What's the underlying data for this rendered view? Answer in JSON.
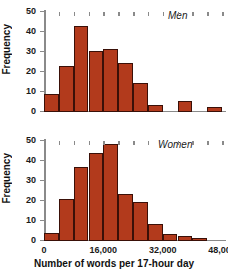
{
  "chart_data": [
    {
      "type": "bar",
      "title": "Men",
      "xlabel": "Number of words per 17-hour day",
      "ylabel": "Frequency",
      "bin_width": 4000,
      "bin_starts": [
        0,
        4000,
        8000,
        12000,
        16000,
        20000,
        24000,
        28000,
        32000,
        36000,
        40000,
        44000
      ],
      "categories": [
        "0-4,000",
        "4,000-8,000",
        "8,000-12,000",
        "12,000-16,000",
        "16,000-20,000",
        "20,000-24,000",
        "24,000-28,000",
        "28,000-32,000",
        "32,000-36,000",
        "36,000-40,000",
        "40,000-44,000",
        "44,000-48,000"
      ],
      "values": [
        9,
        23,
        43,
        30.5,
        31.5,
        24.5,
        14.5,
        3.5,
        0,
        5.5,
        0,
        2.5
      ],
      "xlim": [
        0,
        48000
      ],
      "ylim": [
        0,
        50
      ],
      "ytick_values": [
        0,
        10,
        20,
        30,
        40,
        50
      ],
      "ytick_labels": [
        "0",
        "10",
        "20",
        "30",
        "40",
        "50"
      ],
      "xtick_values": [
        0,
        4000,
        8000,
        12000,
        16000,
        20000,
        24000,
        28000,
        32000,
        36000,
        40000,
        44000,
        48000
      ],
      "xtick_labels": [
        "",
        "",
        "",
        "",
        "",
        "",
        "",
        "",
        "",
        "",
        "",
        "",
        ""
      ],
      "grid": false,
      "bar_color": "#b23a1c",
      "bar_edge_color": "#3a1008"
    },
    {
      "type": "bar",
      "title": "Women",
      "xlabel": "Number of words per 17-hour day",
      "ylabel": "Frequency",
      "bin_width": 4000,
      "bin_starts": [
        0,
        4000,
        8000,
        12000,
        16000,
        20000,
        24000,
        28000,
        32000,
        36000,
        40000
      ],
      "categories": [
        "0-4,000",
        "4,000-8,000",
        "8,000-12,000",
        "12,000-16,000",
        "16,000-20,000",
        "20,000-24,000",
        "24,000-28,000",
        "28,000-32,000",
        "32,000-36,000",
        "36,000-40,000",
        "40,000-44,000",
        "44,000-48,000"
      ],
      "values": [
        4,
        21,
        37,
        44,
        48.5,
        23.5,
        19.5,
        8.5,
        3.5,
        2.5,
        1.5,
        0
      ],
      "xlim": [
        0,
        48000
      ],
      "ylim": [
        0,
        50
      ],
      "ytick_values": [
        0,
        10,
        20,
        30,
        40,
        50
      ],
      "ytick_labels": [
        "0",
        "10",
        "20",
        "30",
        "40",
        "50"
      ],
      "xtick_values": [
        0,
        4000,
        8000,
        12000,
        16000,
        20000,
        24000,
        28000,
        32000,
        36000,
        40000,
        44000,
        48000
      ],
      "xtick_labels": [
        "0",
        "",
        "",
        "",
        "16,000",
        "",
        "",
        "",
        "32,000",
        "",
        "",
        "",
        "48,000"
      ],
      "grid": false,
      "bar_color": "#b23a1c",
      "bar_edge_color": "#3a1008"
    }
  ],
  "figure": {
    "xlabel": "Number of words per 17-hour day",
    "ylabel_top": "Frequency",
    "ylabel_bottom": "Frequency",
    "label_top": "Men",
    "label_bottom": "Women",
    "background": "#ffffff",
    "axis_color": "#8a8a8a",
    "text_color": "#111111"
  }
}
